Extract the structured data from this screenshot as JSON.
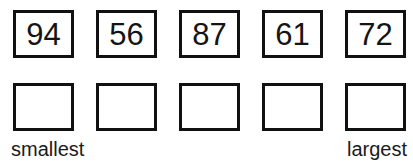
{
  "worksheet": {
    "title": "Order the numbers worksheet",
    "value_row": {
      "name": "given-numbers-row",
      "cells": [
        {
          "value": "94"
        },
        {
          "value": "56"
        },
        {
          "value": "87"
        },
        {
          "value": "61"
        },
        {
          "value": "72"
        }
      ]
    },
    "answer_row": {
      "name": "answer-boxes-row",
      "cells": [
        {
          "value": ""
        },
        {
          "value": ""
        },
        {
          "value": ""
        },
        {
          "value": ""
        },
        {
          "value": ""
        }
      ]
    },
    "labels": {
      "left": "smallest",
      "right": "largest"
    },
    "colors": {
      "border": "#111111",
      "text": "#1a1a1a",
      "background": "#ffffff"
    }
  }
}
